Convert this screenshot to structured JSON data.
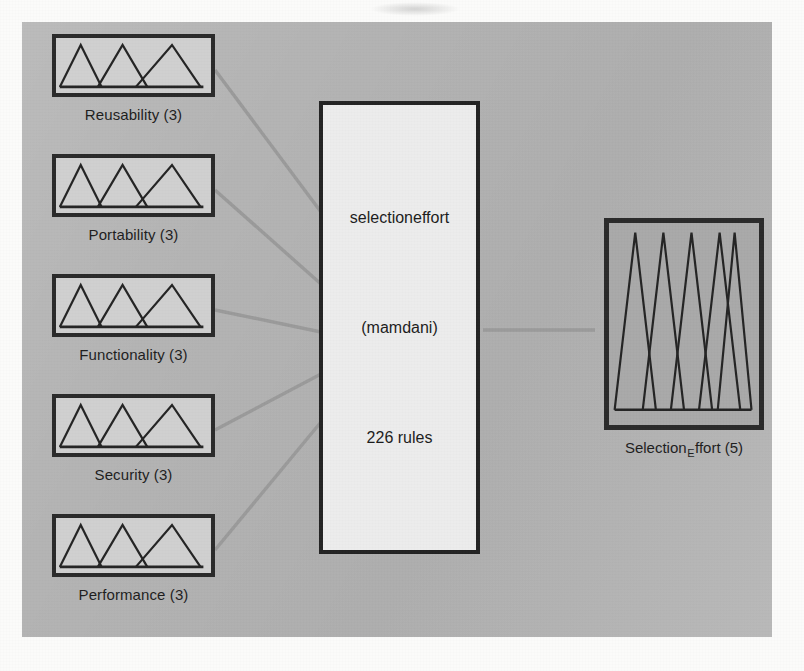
{
  "diagram": {
    "type": "fuzzy-inference-system",
    "canvas_color": "#b4b4b4",
    "line_color": "#9a9a9a",
    "border_color": "#2a2a2a",
    "inputs": [
      {
        "id": "reusability",
        "label": "Reusability (3)",
        "mf_count": 3
      },
      {
        "id": "portability",
        "label": "Portability (3)",
        "mf_count": 3
      },
      {
        "id": "functionality",
        "label": "Functionality (3)",
        "mf_count": 3
      },
      {
        "id": "security",
        "label": "Security (3)",
        "mf_count": 3
      },
      {
        "id": "performance",
        "label": "Performance (3)",
        "mf_count": 3
      }
    ],
    "system": {
      "name": "selectioneffort",
      "inference_type": "(mamdani)",
      "rules": "226 rules"
    },
    "output": {
      "id": "selection_effort",
      "label_prefix": "Selection",
      "label_subscript": "E",
      "label_suffix": "ffort (5)",
      "mf_count": 5
    }
  }
}
